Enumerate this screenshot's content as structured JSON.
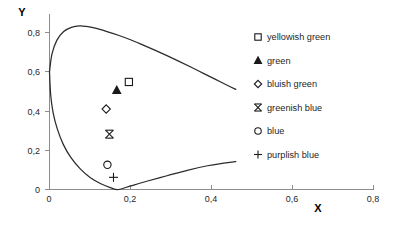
{
  "chart_data": {
    "type": "scatter",
    "title": "",
    "xlabel": "X",
    "ylabel": "Y",
    "xlim": [
      0,
      0.8
    ],
    "ylim": [
      0,
      0.8
    ],
    "xticks": [
      "0",
      "0,2",
      "0,4",
      "0,6",
      "0,8"
    ],
    "xtick_values": [
      0,
      0.2,
      0.4,
      0.6,
      0.8
    ],
    "yticks": [
      "0",
      "0,2",
      "0,4",
      "0,6",
      "0,8"
    ],
    "ytick_values": [
      0,
      0.2,
      0.4,
      0.6,
      0.8
    ],
    "grid": false,
    "legend_position": "right",
    "series": [
      {
        "name": "yellowish green",
        "marker": "open-square",
        "x": 0.196,
        "y": 0.548
      },
      {
        "name": "green",
        "marker": "filled-triangle",
        "x": 0.166,
        "y": 0.506
      },
      {
        "name": "bluish green",
        "marker": "open-diamond",
        "x": 0.14,
        "y": 0.41
      },
      {
        "name": "greenish blue",
        "marker": "bowtie-x",
        "x": 0.148,
        "y": 0.282
      },
      {
        "name": "blue",
        "marker": "open-circle",
        "x": 0.143,
        "y": 0.126
      },
      {
        "name": "purplish blue",
        "marker": "plus",
        "x": 0.158,
        "y": 0.062
      }
    ],
    "annotations": [
      {
        "name": "spectral-locus",
        "description": "CIE 1931 chromaticity horseshoe boundary"
      },
      {
        "name": "purple-line",
        "description": "line of purples closing the lower boundary"
      }
    ],
    "locus_upper": [
      [
        0.0,
        0.6
      ],
      [
        0.006,
        0.69
      ],
      [
        0.018,
        0.76
      ],
      [
        0.035,
        0.805
      ],
      [
        0.054,
        0.826
      ],
      [
        0.074,
        0.834
      ],
      [
        0.091,
        0.831
      ],
      [
        0.113,
        0.822
      ],
      [
        0.14,
        0.806
      ],
      [
        0.17,
        0.786
      ],
      [
        0.2,
        0.763
      ],
      [
        0.23,
        0.737
      ],
      [
        0.26,
        0.71
      ],
      [
        0.29,
        0.682
      ],
      [
        0.32,
        0.653
      ],
      [
        0.35,
        0.623
      ],
      [
        0.38,
        0.592
      ],
      [
        0.41,
        0.561
      ],
      [
        0.44,
        0.53
      ],
      [
        0.46,
        0.51
      ]
    ],
    "locus_lower": [
      [
        0.0,
        0.6
      ],
      [
        0.003,
        0.48
      ],
      [
        0.009,
        0.39
      ],
      [
        0.019,
        0.31
      ],
      [
        0.034,
        0.23
      ],
      [
        0.053,
        0.162
      ],
      [
        0.076,
        0.105
      ],
      [
        0.101,
        0.06
      ],
      [
        0.128,
        0.028
      ],
      [
        0.15,
        0.01
      ],
      [
        0.17,
        0.0
      ],
      [
        0.2,
        0.018
      ],
      [
        0.24,
        0.042
      ],
      [
        0.29,
        0.07
      ],
      [
        0.34,
        0.098
      ],
      [
        0.39,
        0.121
      ],
      [
        0.43,
        0.134
      ],
      [
        0.46,
        0.142
      ]
    ]
  },
  "legend": {
    "items": [
      {
        "label": "yellowish green",
        "marker": "open-square"
      },
      {
        "label": "green",
        "marker": "filled-triangle"
      },
      {
        "label": "bluish green",
        "marker": "open-diamond"
      },
      {
        "label": "greenish blue",
        "marker": "bowtie-x"
      },
      {
        "label": "blue",
        "marker": "open-circle"
      },
      {
        "label": "purplish blue",
        "marker": "plus"
      }
    ]
  },
  "axes": {
    "x_title": "X",
    "y_title": "Y"
  },
  "colors": {
    "locus": "#2b2b2b",
    "axis": "#8c8c8c",
    "text": "#1f1f1f",
    "background": "#ffffff"
  }
}
